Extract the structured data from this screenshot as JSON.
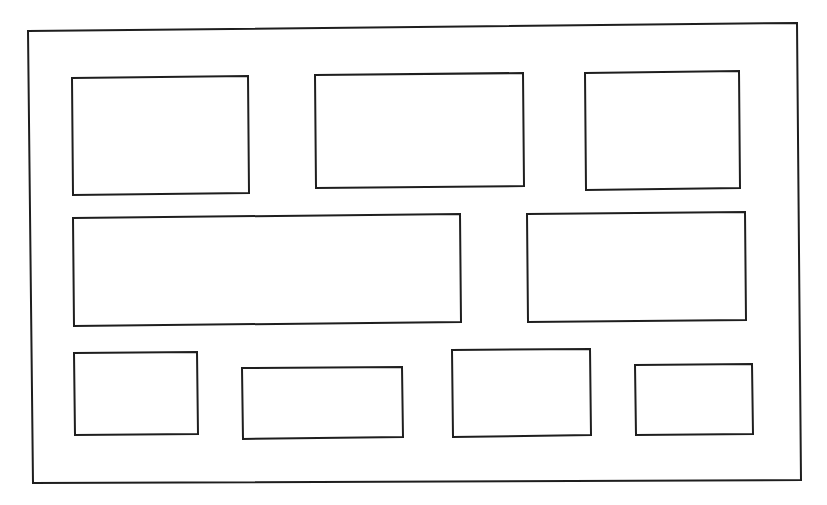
{
  "diagram": {
    "type": "block-layout",
    "stroke_color": "#1e1e1e",
    "background_color": "#ffffff",
    "frame": {
      "name": "outer-frame",
      "points": [
        [
          28,
          31
        ],
        [
          797,
          23
        ],
        [
          801,
          480
        ],
        [
          33,
          483
        ]
      ]
    },
    "rows": [
      {
        "name": "row-1",
        "boxes": [
          {
            "name": "box-row1-1",
            "points": [
              [
                72,
                78
              ],
              [
                248,
                76
              ],
              [
                249,
                193
              ],
              [
                73,
                195
              ]
            ]
          },
          {
            "name": "box-row1-2",
            "points": [
              [
                315,
                75
              ],
              [
                523,
                73
              ],
              [
                524,
                186
              ],
              [
                316,
                188
              ]
            ]
          },
          {
            "name": "box-row1-3",
            "points": [
              [
                585,
                73
              ],
              [
                739,
                71
              ],
              [
                740,
                188
              ],
              [
                586,
                190
              ]
            ]
          }
        ]
      },
      {
        "name": "row-2",
        "boxes": [
          {
            "name": "box-row2-1",
            "points": [
              [
                73,
                218
              ],
              [
                460,
                214
              ],
              [
                461,
                322
              ],
              [
                74,
                326
              ]
            ]
          },
          {
            "name": "box-row2-2",
            "points": [
              [
                527,
                214
              ],
              [
                745,
                212
              ],
              [
                746,
                320
              ],
              [
                528,
                322
              ]
            ]
          }
        ]
      },
      {
        "name": "row-3",
        "boxes": [
          {
            "name": "box-row3-1",
            "points": [
              [
                74,
                353
              ],
              [
                197,
                352
              ],
              [
                198,
                434
              ],
              [
                75,
                435
              ]
            ]
          },
          {
            "name": "box-row3-2",
            "points": [
              [
                242,
                368
              ],
              [
                402,
                367
              ],
              [
                403,
                437
              ],
              [
                243,
                439
              ]
            ]
          },
          {
            "name": "box-row3-3",
            "points": [
              [
                452,
                350
              ],
              [
                590,
                349
              ],
              [
                591,
                435
              ],
              [
                453,
                437
              ]
            ]
          },
          {
            "name": "box-row3-4",
            "points": [
              [
                635,
                365
              ],
              [
                752,
                364
              ],
              [
                753,
                434
              ],
              [
                636,
                435
              ]
            ]
          }
        ]
      }
    ]
  }
}
